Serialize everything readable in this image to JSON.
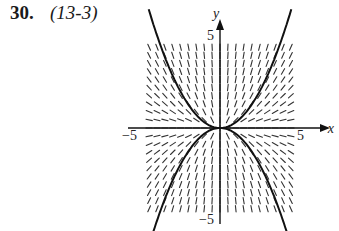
{
  "problem": {
    "number": "30.",
    "reference": "(13-3)"
  },
  "figure": {
    "x_axis_label": "x",
    "y_axis_label": "y",
    "x_min_label": "−5",
    "x_max_label": "5",
    "y_max_label": "5",
    "y_min_label": "−5",
    "range": {
      "x": [
        -5,
        5
      ],
      "y": [
        -5,
        5
      ]
    },
    "slope_field": "dy/dx = 2y/x",
    "solution_curves": [
      "y = x²",
      "y = −x²"
    ],
    "colors": {
      "ink": "#1a1a1a"
    }
  }
}
